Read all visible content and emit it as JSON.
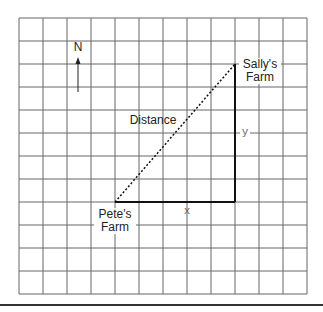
{
  "diagram": {
    "type": "grid-map",
    "grid": {
      "columns": 12,
      "rows": 12
    },
    "compass": {
      "label": "N",
      "icon": "north-arrow-icon"
    },
    "points": {
      "pete": {
        "line1": "Pete's",
        "line2": "Farm"
      },
      "sally": {
        "line1": "Sally's",
        "line2": "Farm"
      }
    },
    "segments": {
      "distance": "Distance",
      "x": "x",
      "y": "y"
    },
    "colors": {
      "grid": "#555555",
      "legs": "#111111",
      "background": "#ffffff"
    }
  }
}
